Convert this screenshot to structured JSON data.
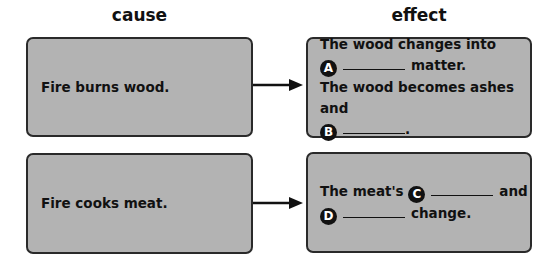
{
  "headings": {
    "cause": "cause",
    "effect": "effect"
  },
  "rows": [
    {
      "cause": "Fire burns wood.",
      "effect": {
        "line1": "The wood changes into",
        "marker_a": "A",
        "line2_tail": "matter.",
        "line3": "The wood becomes ashes and",
        "marker_b": "B",
        "line4_tail": "."
      }
    },
    {
      "cause": "Fire cooks meat.",
      "effect": {
        "line1_head": "The meat's",
        "marker_c": "C",
        "line1_tail": "and",
        "marker_d": "D",
        "line2_tail": "change."
      }
    }
  ],
  "colors": {
    "box_fill": "#b3b3b3",
    "box_border": "#2a2a2a",
    "arrow": "#111111"
  }
}
